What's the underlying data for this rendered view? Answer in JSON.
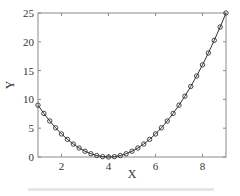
{
  "chart_data": {
    "type": "line",
    "title": "",
    "xlabel": "X",
    "ylabel": "Y",
    "xlim": [
      1,
      9
    ],
    "ylim": [
      0,
      25
    ],
    "xticks": [
      2,
      4,
      6,
      8
    ],
    "yticks": [
      0,
      5,
      10,
      15,
      20,
      25
    ],
    "grid": false,
    "legend": null,
    "series": [
      {
        "name": "y = (x - 4)^2",
        "style": "line with open circle markers",
        "color": "#333333",
        "x": [
          1,
          1.25,
          1.5,
          1.75,
          2,
          2.25,
          2.5,
          2.75,
          3,
          3.25,
          3.5,
          3.75,
          4,
          4.25,
          4.5,
          4.75,
          5,
          5.25,
          5.5,
          5.75,
          6,
          6.25,
          6.5,
          6.75,
          7,
          7.25,
          7.5,
          7.75,
          8,
          8.25,
          8.5,
          8.75,
          9
        ],
        "values": [
          9,
          7.5625,
          6.25,
          5.0625,
          4,
          3.0625,
          2.25,
          1.5625,
          1,
          0.5625,
          0.25,
          0.0625,
          0,
          0.0625,
          0.25,
          0.5625,
          1,
          1.5625,
          2.25,
          3.0625,
          4,
          5.0625,
          6.25,
          7.5625,
          9,
          10.5625,
          12.25,
          14.0625,
          16,
          18.0625,
          20.25,
          22.5625,
          25
        ]
      }
    ]
  },
  "labels": {
    "x_axis": "X",
    "y_axis": "Y"
  }
}
